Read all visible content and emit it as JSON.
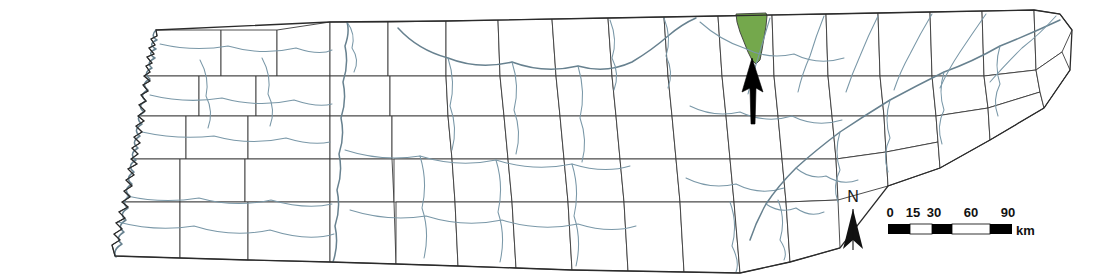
{
  "figure": {
    "type": "map",
    "background_color": "#ffffff",
    "county_fill": "#ffffff",
    "county_stroke": "#3a3a3a",
    "highlight_color": "#74a84c",
    "river_color": "#7a98a8",
    "state_outline_color": "#2b2b2b"
  },
  "highlight": {
    "name": "highlighted-county",
    "fill": "#74a84c",
    "description": "single shaded county in north-central east Tennessee"
  },
  "pointer": {
    "name": "indicator-arrow",
    "color": "#000000",
    "direction": "up"
  },
  "north_arrow": {
    "label": "N",
    "color": "#111111"
  },
  "scale_bar": {
    "ticks": [
      "0",
      "15",
      "30",
      "60",
      "90"
    ],
    "unit": "km",
    "segments": [
      {
        "value": 15,
        "fill": "black"
      },
      {
        "value": 15,
        "fill": "white"
      },
      {
        "value": 30,
        "fill": "black"
      },
      {
        "value": 30,
        "fill": "white"
      },
      {
        "value": 30,
        "fill": "black"
      }
    ]
  }
}
